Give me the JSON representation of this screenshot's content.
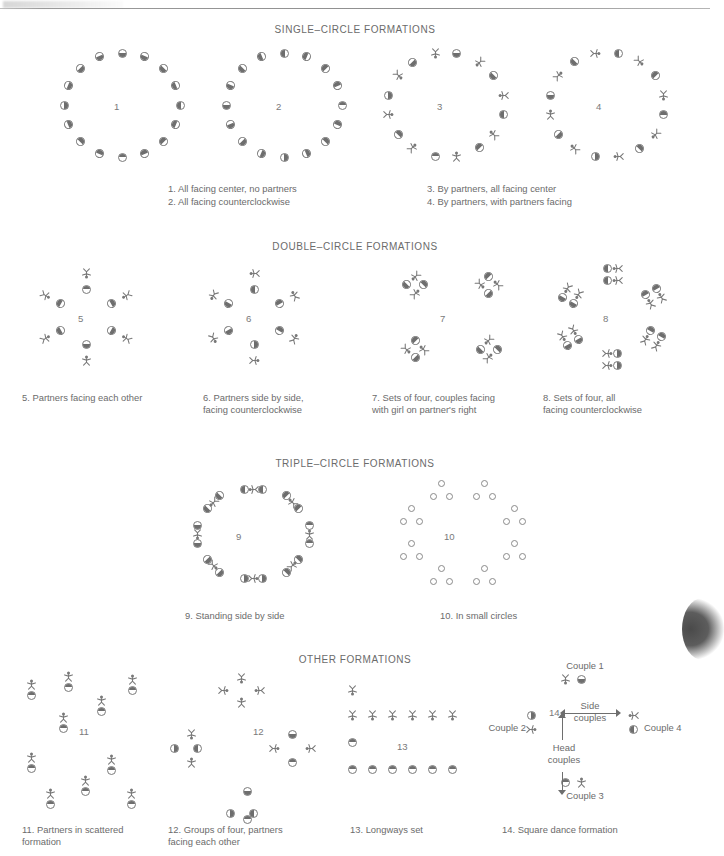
{
  "page": {
    "background_color": "#ffffff",
    "ink_color": "#6b6b6b",
    "has_top_rule": true,
    "has_right_edge_scan_shadow": true
  },
  "sections": [
    {
      "id": "single",
      "heading": "SINGLE–CIRCLE FORMATIONS"
    },
    {
      "id": "double",
      "heading": "DOUBLE–CIRCLE FORMATIONS"
    },
    {
      "id": "triple",
      "heading": "TRIPLE–CIRCLE FORMATIONS"
    },
    {
      "id": "other",
      "heading": "OTHER FORMATIONS"
    }
  ],
  "figures": [
    {
      "number": "1",
      "caption": "1. All facing center, no partners"
    },
    {
      "number": "2",
      "caption": "2. All facing counterclockwise"
    },
    {
      "number": "3",
      "caption": "3. By partners, all facing center"
    },
    {
      "number": "4",
      "caption": "4. By partners, with partners facing"
    },
    {
      "number": "5",
      "caption": "5. Partners facing each other"
    },
    {
      "number": "6",
      "caption": "6. Partners side by side,\n    facing counterclockwise"
    },
    {
      "number": "7",
      "caption": "7. Sets of four, couples facing\n    with girl on partner's right"
    },
    {
      "number": "8",
      "caption": "8. Sets of four, all\n    facing counterclockwise"
    },
    {
      "number": "9",
      "caption": "9. Standing side by side"
    },
    {
      "number": "10",
      "caption": "10. In small circles"
    },
    {
      "number": "11",
      "caption": "11. Partners in scattered\n      formation"
    },
    {
      "number": "12",
      "caption": "12. Groups of four, partners\n      facing each other"
    },
    {
      "number": "13",
      "caption": "13. Longways set"
    },
    {
      "number": "14",
      "caption": "14. Square dance formation"
    }
  ],
  "square_dance_labels": {
    "couple_1": "Couple 1",
    "couple_2": "Couple 2",
    "couple_3": "Couple 3",
    "couple_4": "Couple 4",
    "side_couples": "Side\ncouples",
    "head_couples": "Head\ncouples"
  },
  "legend": {
    "girl_glyph": "half-shaded-circle",
    "boy_glyph": "stick-figure"
  }
}
